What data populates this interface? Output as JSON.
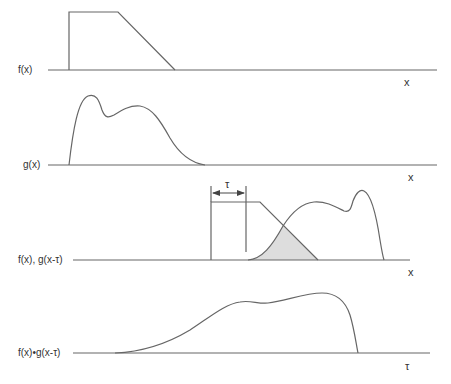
{
  "colors": {
    "line": "#666666",
    "text": "#333333",
    "shade": "#dddddd"
  },
  "panels": [
    {
      "label": "f(x)",
      "axis_var": "x"
    },
    {
      "label": "g(x)",
      "axis_var": "x"
    },
    {
      "label": "f(x), g(x-τ)",
      "axis_var": "x",
      "shift_label": "τ"
    },
    {
      "label": "f(x)•g(x-τ)",
      "axis_var": "τ"
    }
  ]
}
